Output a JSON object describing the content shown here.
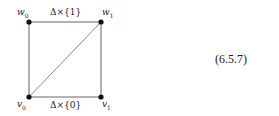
{
  "diagram": {
    "vertices": {
      "w0": {
        "name": "w",
        "sub": "0"
      },
      "w1": {
        "name": "w",
        "sub": "1"
      },
      "v0": {
        "name": "v",
        "sub": "0"
      },
      "v1": {
        "name": "v",
        "sub": "1"
      }
    },
    "edges": {
      "top": "Δ×{1}",
      "bottom": "Δ×{0}"
    },
    "equation_number": "(6.5.7)",
    "colors": {
      "line": "#555555",
      "vertex": "#111111"
    }
  }
}
